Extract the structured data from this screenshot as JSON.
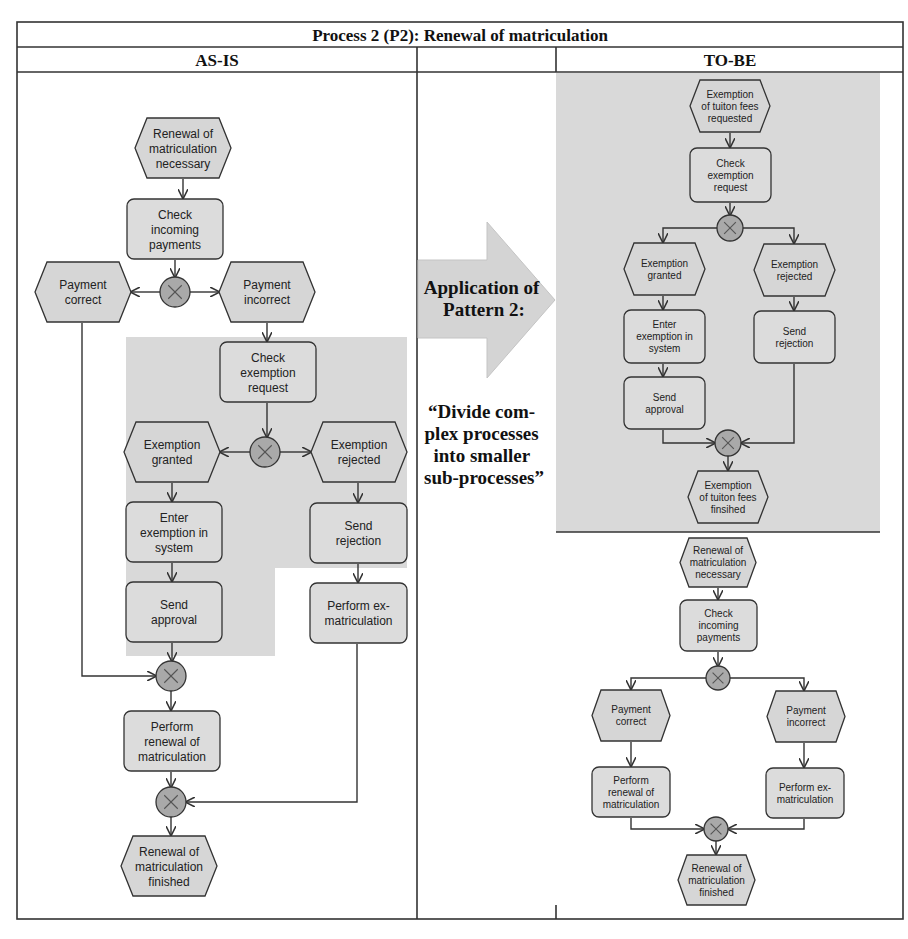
{
  "table": {
    "title": "Process 2 (P2): Renewal of matriculation",
    "col_asis": "AS-IS",
    "col_middle": "",
    "col_tobe": "TO-BE"
  },
  "middle": {
    "arrow_label": [
      "Application of",
      "Pattern 2:"
    ],
    "quote": [
      "“Divide com-",
      "plex processes",
      "into smaller",
      "sub-processes”"
    ]
  },
  "colors": {
    "highlight_bg": "#d9d9d9",
    "event_fill": "#d6d6d6",
    "function_fill": "#dcdcdc",
    "xor_fill": "#a9a9a9",
    "border": "#333333"
  },
  "diagram": {
    "asis": {
      "nodes": [
        {
          "id": "a_e1",
          "type": "event",
          "x": 135,
          "y": 118,
          "w": 96,
          "h": 60,
          "lines": [
            "Renewal of",
            "matriculation",
            "necessary"
          ]
        },
        {
          "id": "a_f1",
          "type": "function",
          "x": 127,
          "y": 199,
          "w": 96,
          "h": 60,
          "lines": [
            "Check",
            "incoming",
            "payments"
          ]
        },
        {
          "id": "a_x1",
          "type": "xor",
          "cx": 175,
          "cy": 292,
          "r": 15
        },
        {
          "id": "a_e2",
          "type": "event",
          "x": 35,
          "y": 262,
          "w": 96,
          "h": 60,
          "lines": [
            "Payment",
            "correct"
          ]
        },
        {
          "id": "a_e3",
          "type": "event",
          "x": 219,
          "y": 262,
          "w": 96,
          "h": 60,
          "lines": [
            "Payment",
            "incorrect"
          ]
        },
        {
          "id": "a_f2",
          "type": "function",
          "x": 220,
          "y": 342,
          "w": 96,
          "h": 60,
          "lines": [
            "Check",
            "exemption",
            "request"
          ]
        },
        {
          "id": "a_x2",
          "type": "xor",
          "cx": 265,
          "cy": 452,
          "r": 15
        },
        {
          "id": "a_e4",
          "type": "event",
          "x": 124,
          "y": 422,
          "w": 96,
          "h": 60,
          "lines": [
            "Exemption",
            "granted"
          ]
        },
        {
          "id": "a_e5",
          "type": "event",
          "x": 311,
          "y": 422,
          "w": 96,
          "h": 60,
          "lines": [
            "Exemption",
            "rejected"
          ]
        },
        {
          "id": "a_f3",
          "type": "function",
          "x": 126,
          "y": 502,
          "w": 96,
          "h": 60,
          "lines": [
            "Enter",
            "exemption in",
            "system"
          ]
        },
        {
          "id": "a_f4",
          "type": "function",
          "x": 310,
          "y": 503,
          "w": 97,
          "h": 60,
          "lines": [
            "Send",
            "rejection"
          ]
        },
        {
          "id": "a_f5",
          "type": "function",
          "x": 126,
          "y": 582,
          "w": 96,
          "h": 60,
          "lines": [
            "Send",
            "approval"
          ]
        },
        {
          "id": "a_f6",
          "type": "function",
          "x": 310,
          "y": 583,
          "w": 97,
          "h": 60,
          "lines": [
            "Perform ex-",
            "matriculation"
          ]
        },
        {
          "id": "a_x3",
          "type": "xor",
          "cx": 171,
          "cy": 676,
          "r": 15
        },
        {
          "id": "a_f7",
          "type": "function",
          "x": 124,
          "y": 711,
          "w": 96,
          "h": 60,
          "lines": [
            "Perform",
            "renewal of",
            "matriculation"
          ]
        },
        {
          "id": "a_x4",
          "type": "xor",
          "cx": 171,
          "cy": 802,
          "r": 15
        },
        {
          "id": "a_e6",
          "type": "event",
          "x": 121,
          "y": 836,
          "w": 96,
          "h": 60,
          "lines": [
            "Renewal of",
            "matriculation",
            "finished"
          ]
        }
      ],
      "edges": [
        "M183,179 L183,198",
        "M175,260 L175,277",
        "M160,292 L131,292",
        "M190,292 L219,292",
        "M267,323 L267,341",
        "M267,403 L267,437",
        "M250,452 L220,452",
        "M280,452 L311,452",
        "M172,483 L172,501",
        "M358,483 L358,502",
        "M172,563 L172,581",
        "M358,564 L358,582",
        "M172,643 L172,661",
        "M82,323 L82,676 L156,676",
        "M171,691 L171,710",
        "M171,772 L171,787",
        "M357,644 L357,802 L186,802",
        "M171,817 L171,835"
      ]
    },
    "tobe_top": {
      "nodes": [
        {
          "id": "t_e1",
          "type": "event",
          "x": 690,
          "y": 80,
          "w": 80,
          "h": 52,
          "lines": [
            "Exemption",
            "of tuiton fees",
            "requested"
          ],
          "small": true
        },
        {
          "id": "t_f1",
          "type": "function",
          "x": 690,
          "y": 148,
          "w": 81,
          "h": 54,
          "lines": [
            "Check",
            "exemption",
            "request"
          ],
          "small": true
        },
        {
          "id": "t_x1",
          "type": "xor",
          "cx": 730,
          "cy": 228,
          "r": 13
        },
        {
          "id": "t_e2",
          "type": "event",
          "x": 624,
          "y": 243,
          "w": 81,
          "h": 52,
          "lines": [
            "Exemption",
            "granted"
          ],
          "small": true
        },
        {
          "id": "t_e3",
          "type": "event",
          "x": 754,
          "y": 244,
          "w": 81,
          "h": 52,
          "lines": [
            "Exemption",
            "rejected"
          ],
          "small": true
        },
        {
          "id": "t_f2",
          "type": "function",
          "x": 624,
          "y": 310,
          "w": 81,
          "h": 53,
          "lines": [
            "Enter",
            "exemption in",
            "system"
          ],
          "small": true
        },
        {
          "id": "t_f3",
          "type": "function",
          "x": 754,
          "y": 311,
          "w": 81,
          "h": 52,
          "lines": [
            "Send",
            "rejection"
          ],
          "small": true
        },
        {
          "id": "t_f4",
          "type": "function",
          "x": 624,
          "y": 377,
          "w": 81,
          "h": 52,
          "lines": [
            "Send",
            "approval"
          ],
          "small": true
        },
        {
          "id": "t_x2",
          "type": "xor",
          "cx": 728,
          "cy": 443,
          "r": 13
        },
        {
          "id": "t_e4",
          "type": "event",
          "x": 688,
          "y": 471,
          "w": 80,
          "h": 52,
          "lines": [
            "Exemption",
            "of tuiton fees",
            "finsihed"
          ],
          "small": true
        }
      ],
      "edges": [
        "M730,133 L730,147",
        "M730,203 L730,215",
        "M717,228 L663,228 L663,242",
        "M743,228 L794,228 L794,243",
        "M663,296 L663,309",
        "M794,297 L794,310",
        "M663,364 L663,376",
        "M663,430 L663,443 L715,443",
        "M794,364 L794,443 L741,443",
        "M728,456 L728,470"
      ]
    },
    "tobe_bottom": {
      "nodes": [
        {
          "id": "b_e1",
          "type": "event",
          "x": 680,
          "y": 538,
          "w": 76,
          "h": 49,
          "lines": [
            "Renewal of",
            "matriculation",
            "necessary"
          ],
          "small": true
        },
        {
          "id": "b_f1",
          "type": "function",
          "x": 680,
          "y": 600,
          "w": 77,
          "h": 51,
          "lines": [
            "Check",
            "incoming",
            "payments"
          ],
          "small": true
        },
        {
          "id": "b_x1",
          "type": "xor",
          "cx": 718,
          "cy": 678,
          "r": 12
        },
        {
          "id": "b_e2",
          "type": "event",
          "x": 592,
          "y": 690,
          "w": 78,
          "h": 51,
          "lines": [
            "Payment",
            "correct"
          ],
          "small": true
        },
        {
          "id": "b_e3",
          "type": "event",
          "x": 767,
          "y": 691,
          "w": 78,
          "h": 51,
          "lines": [
            "Payment",
            "incorrect"
          ],
          "small": true
        },
        {
          "id": "b_f2",
          "type": "function",
          "x": 592,
          "y": 767,
          "w": 78,
          "h": 50,
          "lines": [
            "Perform",
            "renewal of",
            "matriculation"
          ],
          "small": true
        },
        {
          "id": "b_f3",
          "type": "function",
          "x": 766,
          "y": 768,
          "w": 78,
          "h": 50,
          "lines": [
            "Perform ex-",
            "matriculation"
          ],
          "small": true
        },
        {
          "id": "b_x2",
          "type": "xor",
          "cx": 716,
          "cy": 829,
          "r": 12
        },
        {
          "id": "b_e4",
          "type": "event",
          "x": 678,
          "y": 855,
          "w": 77,
          "h": 50,
          "lines": [
            "Renewal of",
            "matriculation",
            "finished"
          ],
          "small": true
        }
      ],
      "edges": [
        "M718,588 L718,599",
        "M718,652 L718,666",
        "M706,678 L631,678 L631,689",
        "M730,678 L804,678 L804,690",
        "M631,742 L631,766",
        "M804,743 L804,767",
        "M631,818 L631,829 L704,829",
        "M804,819 L804,829 L728,829",
        "M716,841 L716,854"
      ]
    }
  }
}
